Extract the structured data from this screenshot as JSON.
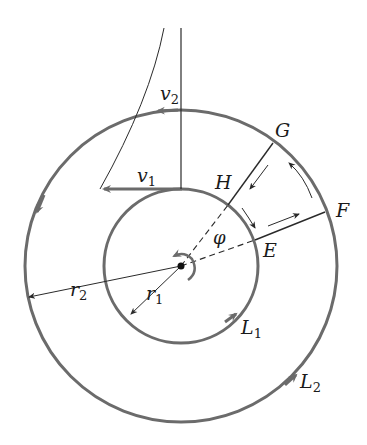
{
  "figure": {
    "colors": {
      "circle_stroke": "#6b6b6b",
      "line_stroke": "#2a2a2a",
      "text": "#1a1a1a"
    }
  },
  "labels": {
    "v2": {
      "main": "v",
      "sub": "2"
    },
    "v1": {
      "main": "v",
      "sub": "1"
    },
    "G": "G",
    "H": "H",
    "F": "F",
    "E": "E",
    "phi": "φ",
    "r2": {
      "main": "r",
      "sub": "2"
    },
    "r1": {
      "main": "r",
      "sub": "1"
    },
    "L1": {
      "main": "L",
      "sub": "1"
    },
    "L2": {
      "main": "L",
      "sub": "2"
    }
  }
}
